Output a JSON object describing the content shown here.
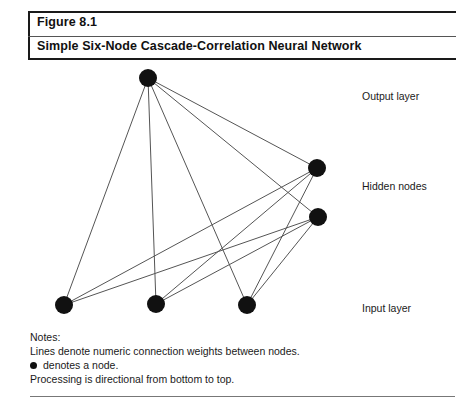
{
  "figure": {
    "number": "Figure 8.1",
    "title": "Simple Six-Node Cascade-Correlation Neural Network"
  },
  "labels": {
    "output": "Output layer",
    "hidden": "Hidden nodes",
    "input": "Input layer"
  },
  "notes": {
    "heading": "Notes:",
    "line_lines": "Lines denote numeric connection weights between nodes.",
    "line_bullet": "denotes a node.",
    "line_processing": "Processing is directional from bottom to top."
  },
  "colors": {
    "node": "#111111",
    "edge": "#555555",
    "rule": "#1a1a1a",
    "text": "#1a1a1a",
    "background": "#ffffff"
  },
  "chart_data": {
    "type": "diagram",
    "title": "Simple Six-Node Cascade-Correlation Neural Network",
    "node_radius": 9,
    "nodes": [
      {
        "id": "output",
        "label": "Output node",
        "layer": "output",
        "x": 148,
        "y": 78
      },
      {
        "id": "hidden1",
        "label": "Hidden node 1",
        "layer": "hidden",
        "x": 317,
        "y": 168
      },
      {
        "id": "hidden2",
        "label": "Hidden node 2",
        "layer": "hidden",
        "x": 318,
        "y": 217
      },
      {
        "id": "input1",
        "label": "Input node 1",
        "layer": "input",
        "x": 64,
        "y": 305
      },
      {
        "id": "input2",
        "label": "Input node 2",
        "layer": "input",
        "x": 156,
        "y": 304
      },
      {
        "id": "input3",
        "label": "Input node 3",
        "layer": "input",
        "x": 247,
        "y": 305
      }
    ],
    "edges": [
      {
        "from": "input1",
        "to": "output"
      },
      {
        "from": "input2",
        "to": "output"
      },
      {
        "from": "input3",
        "to": "output"
      },
      {
        "from": "input1",
        "to": "hidden1"
      },
      {
        "from": "input1",
        "to": "hidden2"
      },
      {
        "from": "input2",
        "to": "hidden1"
      },
      {
        "from": "input2",
        "to": "hidden2"
      },
      {
        "from": "input3",
        "to": "hidden1"
      },
      {
        "from": "input3",
        "to": "hidden2"
      },
      {
        "from": "hidden1",
        "to": "output"
      },
      {
        "from": "hidden2",
        "to": "output"
      }
    ],
    "node_count": 6,
    "edge_count": 11
  }
}
